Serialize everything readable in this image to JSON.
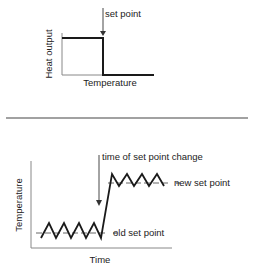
{
  "top_diagram": {
    "ylabel": "Heat output",
    "xlabel": "Temperature",
    "annotation": "set point",
    "description": "Heat output is high below the set point and drops to zero above it"
  },
  "bottom_diagram": {
    "ylabel": "Temperature",
    "xlabel": "Time",
    "annotation_top": "time of set point change",
    "label_new": "new set point",
    "label_old": "old set point",
    "description": "Temperature oscillates around old set point, then rises and oscillates around new set point"
  },
  "colors": {
    "line": "#1a1a1a",
    "text": "#222222",
    "background": "#ffffff"
  }
}
